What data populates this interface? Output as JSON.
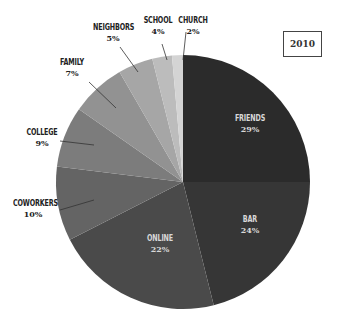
{
  "chart_data": {
    "type": "pie",
    "title": "",
    "annotation": "2010",
    "start_angle_deg": 0,
    "direction": "clockwise",
    "slices": [
      {
        "label": "FRIENDS",
        "value": 29,
        "pct_label": "29%",
        "color": "#2b2b2b",
        "end_deg": 90
      },
      {
        "label": "BAR",
        "value": 24,
        "pct_label": "24%",
        "color": "#363636",
        "end_deg": 166
      },
      {
        "label": "ONLINE",
        "value": 22,
        "pct_label": "22%",
        "color": "#4a4a4a",
        "end_deg": 243
      },
      {
        "label": "COWORKERS",
        "value": 10,
        "pct_label": "10%",
        "color": "#646464",
        "end_deg": 277
      },
      {
        "label": "COLLEGE",
        "value": 9,
        "pct_label": "9%",
        "color": "#7c7c7c",
        "end_deg": 305
      },
      {
        "label": "FAMILY",
        "value": 7,
        "pct_label": "7%",
        "color": "#929292",
        "end_deg": 330
      },
      {
        "label": "NEIGHBORS",
        "value": 5,
        "pct_label": "5%",
        "color": "#a6a6a6",
        "end_deg": 346
      },
      {
        "label": "SCHOOL",
        "value": 4,
        "pct_label": "4%",
        "color": "#bcbcbc",
        "end_deg": 355
      },
      {
        "label": "CHURCH",
        "value": 2,
        "pct_label": "2%",
        "color": "#d4d4d4",
        "end_deg": 360
      }
    ],
    "legend": null
  },
  "labels": {
    "friends": {
      "name": "FRIENDS",
      "pct": "29%"
    },
    "bar": {
      "name": "BAR",
      "pct": "24%"
    },
    "online": {
      "name": "ONLINE",
      "pct": "22%"
    },
    "coworkers": {
      "name": "COWORKERS",
      "pct": "10%"
    },
    "college": {
      "name": "COLLEGE",
      "pct": "9%"
    },
    "family": {
      "name": "FAMILY",
      "pct": "7%"
    },
    "neighbors": {
      "name": "NEIGHBORS",
      "pct": "5%"
    },
    "school": {
      "name": "SCHOOL",
      "pct": "4%"
    },
    "church": {
      "name": "CHURCH",
      "pct": "2%"
    }
  },
  "year_box": "2010"
}
